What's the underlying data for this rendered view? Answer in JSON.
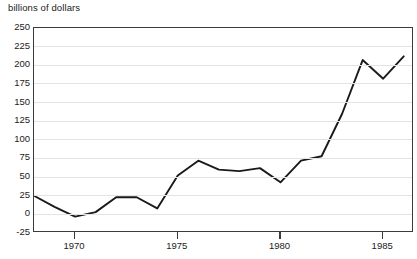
{
  "chart_data": {
    "type": "line",
    "title": "billions of dollars",
    "xlabel": "",
    "ylabel": "billions of dollars",
    "ylim": [
      -25,
      250
    ],
    "xlim": [
      1968,
      1986.5
    ],
    "grid": true,
    "legend": "none",
    "y_ticks": [
      250,
      225,
      200,
      175,
      150,
      125,
      100,
      75,
      50,
      25,
      0,
      -25
    ],
    "y_tick_labels": [
      "250",
      "225",
      "200",
      "175",
      "150",
      "125",
      "100",
      "75",
      "50",
      "25",
      "0",
      "-25"
    ],
    "x_ticks": [
      1970,
      1975,
      1980,
      1985
    ],
    "x_tick_labels": [
      "1970",
      "1975",
      "1980",
      "1985"
    ],
    "x": [
      1968,
      1969,
      1970,
      1971,
      1972,
      1973,
      1974,
      1975,
      1976,
      1977,
      1978,
      1979,
      1980,
      1981,
      1982,
      1983,
      1984,
      1985,
      1986
    ],
    "values": [
      25,
      10,
      -3,
      3,
      23,
      23,
      8,
      52,
      72,
      60,
      58,
      62,
      43,
      72,
      78,
      135,
      207,
      182,
      212
    ],
    "series": [
      {
        "name": "billions of dollars",
        "color": "#1a1a1a",
        "values": [
          25,
          10,
          -3,
          3,
          23,
          23,
          8,
          52,
          72,
          60,
          58,
          62,
          43,
          72,
          78,
          135,
          207,
          182,
          212
        ]
      }
    ],
    "colors": {
      "line": "#1a1a1a",
      "grid": "#e3e3e3",
      "frame": "#3b3b3b",
      "background": "#ffffff",
      "text": "#1b1b1b"
    }
  }
}
